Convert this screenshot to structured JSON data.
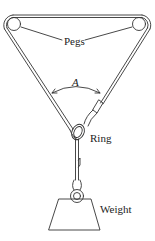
{
  "diagram": {
    "labels": {
      "pegs": "Pegs",
      "angle": "A",
      "ring": "Ring",
      "weight": "Weight"
    },
    "colors": {
      "stroke": "#333333",
      "background": "#ffffff",
      "text": "#222222"
    }
  }
}
